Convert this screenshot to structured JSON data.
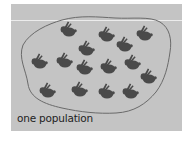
{
  "figure": {
    "caption": "one population",
    "colors": {
      "background": "#c4c4c4",
      "outline": "#6a6a6a",
      "rabbit": "#4a4a4a",
      "text": "#1e1e1e"
    },
    "rabbit_count": 16,
    "rabbits": [
      {
        "x": 69,
        "y": 30
      },
      {
        "x": 107,
        "y": 35
      },
      {
        "x": 145,
        "y": 34
      },
      {
        "x": 87,
        "y": 49
      },
      {
        "x": 125,
        "y": 45
      },
      {
        "x": 40,
        "y": 62
      },
      {
        "x": 65,
        "y": 61
      },
      {
        "x": 85,
        "y": 68
      },
      {
        "x": 109,
        "y": 67
      },
      {
        "x": 133,
        "y": 63
      },
      {
        "x": 149,
        "y": 77
      },
      {
        "x": 48,
        "y": 91
      },
      {
        "x": 80,
        "y": 90
      },
      {
        "x": 107,
        "y": 92
      },
      {
        "x": 131,
        "y": 92
      }
    ]
  }
}
